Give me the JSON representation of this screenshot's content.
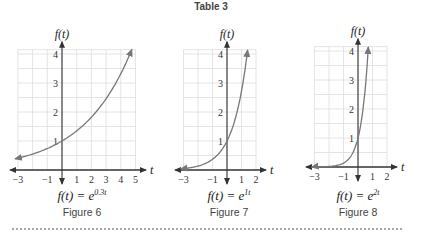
{
  "title": "Table 3",
  "colors": {
    "curve": "#777777",
    "axis": "#333333",
    "grid": "#dddddd",
    "text": "#444444"
  },
  "chart_data": [
    {
      "type": "line",
      "title": "Figure 6",
      "equation": {
        "lhs": "f(t) = e",
        "exp": "0.3t"
      },
      "xlabel": "t",
      "ylabel": "f(t)",
      "xlim": [
        -3,
        5
      ],
      "ylim": [
        0,
        4.2
      ],
      "xticks": [
        -3,
        -1,
        1,
        2,
        3,
        4,
        5
      ],
      "yticks": [
        1,
        2,
        3,
        4
      ],
      "grid": true,
      "series": [
        {
          "name": "e^(0.3t)",
          "x": [
            -3,
            -2,
            -1,
            0,
            1,
            2,
            3,
            4,
            4.7
          ],
          "values": [
            0.41,
            0.55,
            0.74,
            1.0,
            1.35,
            1.82,
            2.46,
            3.32,
            4.1
          ]
        }
      ]
    },
    {
      "type": "line",
      "title": "Figure 7",
      "equation": {
        "lhs": "f(t) = e",
        "exp": "1t"
      },
      "xlabel": "t",
      "ylabel": "f(t)",
      "xlim": [
        -3,
        2
      ],
      "ylim": [
        0,
        4.2
      ],
      "xticks": [
        -3,
        -1,
        1,
        2
      ],
      "yticks": [
        1,
        2,
        3,
        4
      ],
      "grid": true,
      "series": [
        {
          "name": "e^(1t)",
          "x": [
            -3,
            -2,
            -1,
            0,
            0.5,
            1,
            1.4
          ],
          "values": [
            0.05,
            0.14,
            0.37,
            1.0,
            1.65,
            2.72,
            4.06
          ]
        }
      ]
    },
    {
      "type": "line",
      "title": "Figure 8",
      "equation": {
        "lhs": "f(t) = e",
        "exp": "2t"
      },
      "xlabel": "t",
      "ylabel": "f(t)",
      "xlim": [
        -3,
        2
      ],
      "ylim": [
        0,
        4.2
      ],
      "xticks": [
        -3,
        -1,
        1,
        2
      ],
      "yticks": [
        1,
        2,
        3,
        4
      ],
      "grid": true,
      "series": [
        {
          "name": "e^(2t)",
          "x": [
            -3,
            -2,
            -1,
            -0.5,
            0,
            0.3,
            0.5,
            0.7
          ],
          "values": [
            0.0025,
            0.018,
            0.135,
            0.37,
            1.0,
            1.82,
            2.72,
            4.06
          ]
        }
      ]
    }
  ],
  "labels": {
    "fig6": "Figure 6",
    "fig7": "Figure 7",
    "fig8": "Figure 8",
    "eq6_lhs": "f(t) = e",
    "eq6_exp": "0.3t",
    "eq7_lhs": "f(t) = e",
    "eq7_exp": "1t",
    "eq8_lhs": "f(t) = e",
    "eq8_exp": "2t"
  }
}
